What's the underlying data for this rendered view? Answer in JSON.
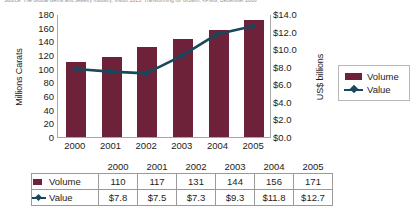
{
  "source_note": "Source:  The Global Gems and Jewelry Industry, Vision 2015: Transforming for Growth, KPMG, December 2006",
  "legend": {
    "volume_label": "Volume",
    "value_label": "Value"
  },
  "colors": {
    "volume": "#6E2239",
    "value": "#17485C"
  },
  "chart_data": {
    "type": "bar",
    "title": "",
    "xlabel": "",
    "categories": [
      "2000",
      "2001",
      "2002",
      "2003",
      "2004",
      "2005"
    ],
    "grid": false,
    "legend_position": "right",
    "series": [
      {
        "name": "Volume",
        "type": "bar",
        "axis": "left",
        "values": [
          110,
          117,
          131,
          144,
          156,
          171
        ],
        "color": "#6E2239"
      },
      {
        "name": "Value",
        "type": "line",
        "axis": "right",
        "values": [
          7.8,
          7.5,
          7.3,
          9.3,
          11.8,
          12.7
        ],
        "value_labels": [
          "$7.8",
          "$7.5",
          "$7.3",
          "$9.3",
          "$11.8",
          "$12.7"
        ],
        "color": "#17485C"
      }
    ],
    "left_axis": {
      "label": "Millions Carats",
      "ylim": [
        0,
        180
      ],
      "ticks": [
        180,
        160,
        140,
        120,
        100,
        80,
        60,
        40,
        20,
        0
      ],
      "tick_labels": [
        "180",
        "160",
        "140",
        "120",
        "100",
        "80",
        "60",
        "40",
        "20",
        "0"
      ]
    },
    "right_axis": {
      "label": "US$ billions",
      "ylim": [
        0,
        14
      ],
      "ticks": [
        14,
        12,
        10,
        8,
        6,
        4,
        2,
        0
      ],
      "tick_labels": [
        "$14.0",
        "$12.0",
        "$10.0",
        "$8.0",
        "$6.0",
        "$4.0",
        "$2.0",
        "$0.0"
      ]
    }
  },
  "table": {
    "column_headers": [
      "2000",
      "2001",
      "2002",
      "2003",
      "2004",
      "2005"
    ],
    "rows": [
      {
        "label": "Volume",
        "values": [
          "110",
          "117",
          "131",
          "144",
          "156",
          "171"
        ]
      },
      {
        "label": "Value",
        "values": [
          "$7.8",
          "$7.5",
          "$7.3",
          "$9.3",
          "$11.8",
          "$12.7"
        ]
      }
    ]
  }
}
